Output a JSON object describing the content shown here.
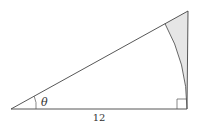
{
  "diagram": {
    "type": "right-triangle",
    "labels": {
      "angle": "θ",
      "adjacent_side": "12"
    },
    "colors": {
      "stroke": "#444444",
      "shade": "#e6e6e6",
      "text": "#333333"
    },
    "elements": [
      "hypotenuse",
      "adjacent-side",
      "opposite-side",
      "right-angle-marker",
      "angle-arc",
      "circular-arc",
      "shaded-region"
    ]
  }
}
